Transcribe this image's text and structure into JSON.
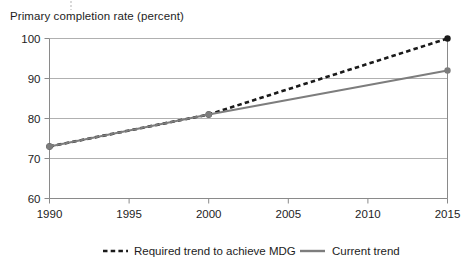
{
  "chart_data": {
    "type": "line",
    "title": "Primary completion rate (percent)",
    "xlabel": "",
    "ylabel": "",
    "x": [
      1990,
      1995,
      2000,
      2005,
      2010,
      2015
    ],
    "xlim": [
      1990,
      2015
    ],
    "ylim": [
      60,
      100
    ],
    "yticks": [
      60,
      70,
      80,
      90,
      100
    ],
    "xticks": [
      1990,
      1995,
      2000,
      2005,
      2010,
      2015
    ],
    "ytick_labels": [
      "60",
      "70",
      "80",
      "90",
      "100"
    ],
    "xtick_labels": [
      "1990",
      "1995",
      "2000",
      "2005",
      "2010",
      "2015"
    ],
    "grid": "horizontal",
    "legend_position": "bottom",
    "series": [
      {
        "name": "Required trend to achieve MDG",
        "style": "dashed",
        "color": "#1a1a1a",
        "points": [
          {
            "x": 1990,
            "y": 73
          },
          {
            "x": 2000,
            "y": 81
          },
          {
            "x": 2015,
            "y": 100
          }
        ],
        "markers": [
          {
            "x": 1990,
            "y": 73
          },
          {
            "x": 2000,
            "y": 81
          },
          {
            "x": 2015,
            "y": 100
          }
        ]
      },
      {
        "name": "Current trend",
        "style": "solid",
        "color": "#7d7d7d",
        "points": [
          {
            "x": 1990,
            "y": 73
          },
          {
            "x": 2000,
            "y": 81
          },
          {
            "x": 2015,
            "y": 92
          }
        ],
        "markers": [
          {
            "x": 1990,
            "y": 73
          },
          {
            "x": 2000,
            "y": 81
          },
          {
            "x": 2015,
            "y": 92
          }
        ]
      }
    ]
  },
  "legend": {
    "items": [
      {
        "label": "Required trend to achieve MDG",
        "style": "dashed",
        "color": "#1a1a1a"
      },
      {
        "label": "Current trend",
        "style": "solid",
        "color": "#7d7d7d"
      }
    ]
  },
  "colors": {
    "required_trend": "#1a1a1a",
    "current_trend": "#7d7d7d",
    "gridline": "#b0b0b0",
    "axis": "#8a8a8a",
    "text": "#1d1d1d",
    "background": "#ffffff"
  }
}
